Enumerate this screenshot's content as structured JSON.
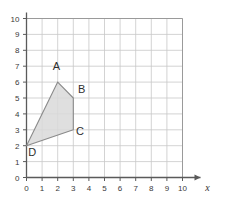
{
  "chart_data": {
    "type": "scatter",
    "title": "",
    "xlabel": "x",
    "ylabel": "",
    "xlim": [
      0,
      10
    ],
    "ylim": [
      0,
      10
    ],
    "grid": true,
    "legend": false,
    "x_ticks": [
      "0",
      "1",
      "2",
      "3",
      "4",
      "5",
      "6",
      "7",
      "8",
      "9",
      "10"
    ],
    "y_ticks": [
      "0",
      "1",
      "2",
      "3",
      "4",
      "5",
      "6",
      "7",
      "8",
      "9",
      "10"
    ],
    "shapes": [
      {
        "name": "quadrilateral-ABCD",
        "closed": true,
        "fill": "#d9d9d9",
        "stroke": "#8a8a8a",
        "points": [
          {
            "label": "A",
            "x": 2,
            "y": 6,
            "label_dx": -0.08,
            "label_dy": 0.75,
            "anchor": "middle"
          },
          {
            "label": "B",
            "x": 3,
            "y": 5,
            "label_dx": 0.3,
            "label_dy": 0.34,
            "anchor": "start"
          },
          {
            "label": "C",
            "x": 3,
            "y": 3,
            "label_dx": 0.18,
            "label_dy": -0.32,
            "anchor": "start"
          },
          {
            "label": "D",
            "x": 0,
            "y": 2,
            "label_dx": 0.12,
            "label_dy": -0.62,
            "anchor": "start"
          }
        ]
      }
    ]
  },
  "colors": {
    "axis": "#5a5a5a",
    "grid": "#c8c8c8",
    "frame": "#9a9a9a",
    "shape_fill": "#d9d9d9",
    "shape_stroke": "#8a8a8a",
    "text": "#2f2f2f",
    "background": "#ffffff"
  },
  "axis_names": {
    "x": "x"
  }
}
